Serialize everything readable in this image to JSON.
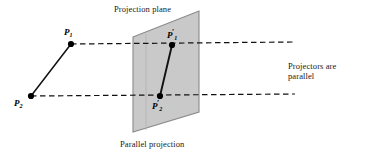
{
  "figure": {
    "title": "Parallel projection",
    "width": 372,
    "height": 160,
    "background": "#ffffff"
  },
  "captions": {
    "projection_plane": "Projection plane",
    "parallel_projection": "Parallel projection",
    "projectors_line1": "Projectors are",
    "projectors_line2": "parallel"
  },
  "point_labels": {
    "p1": {
      "base": "P",
      "subscript": "1",
      "prime": ""
    },
    "p2": {
      "base": "P",
      "subscript": "2",
      "prime": ""
    },
    "p1_prime": {
      "base": "P",
      "subscript": "1",
      "prime": "′"
    },
    "p2_prime": {
      "base": "P",
      "subscript": "2",
      "prime": "′"
    }
  },
  "colors": {
    "plane_fill": "#c9c9c9",
    "plane_edge": "#8a8a8a",
    "line": "#111111",
    "dot": "#000000",
    "text": "#1a1a1a"
  },
  "geometry": {
    "plane_polygon": "133,37 199,11 199,112 133,132",
    "plane_inner_line": "146,34 146,130",
    "object_segment": {
      "x1": 71,
      "y1": 44,
      "x2": 31,
      "y2": 96
    },
    "image_segment": {
      "x1": 172,
      "y1": 45,
      "x2": 160,
      "y2": 96
    },
    "projector_top": {
      "x1": 71,
      "y1": 44,
      "x2": 295,
      "y2": 42
    },
    "projector_bottom": {
      "x1": 31,
      "y1": 96,
      "x2": 295,
      "y2": 94
    },
    "points": [
      {
        "name": "P1",
        "x": 71,
        "y": 44,
        "r": 3.1
      },
      {
        "name": "P2",
        "x": 31,
        "y": 96,
        "r": 3.1
      },
      {
        "name": "P1prime",
        "x": 172,
        "y": 45,
        "r": 3.1
      },
      {
        "name": "P2prime",
        "x": 160,
        "y": 96,
        "r": 3.1
      }
    ]
  }
}
